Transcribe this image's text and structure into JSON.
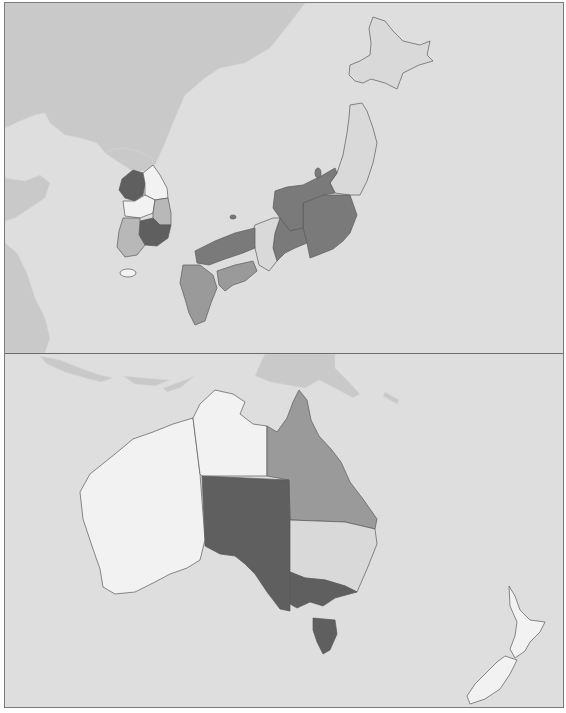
{
  "map": {
    "type": "choropleth",
    "palette": {
      "sea": "#dedede",
      "background_land": "#c9c9c9",
      "level_0": "#f2f2f2",
      "level_1": "#d9d9d9",
      "level_2": "#b8b8b8",
      "level_3": "#9a9a9a",
      "level_4": "#7a7a7a",
      "level_5": "#5f5f5f",
      "border": "#5a5a5a",
      "frame": "#7a7a7a"
    },
    "panels": [
      {
        "name": "East Asia (Japan & Korea)",
        "regions": [
          {
            "name": "Hokkaido",
            "level": 1
          },
          {
            "name": "Tohoku",
            "level": 1
          },
          {
            "name": "Kanto",
            "level": 4
          },
          {
            "name": "Chubu",
            "level": 4
          },
          {
            "name": "Tokai",
            "level": 4
          },
          {
            "name": "Kansai",
            "level": 1
          },
          {
            "name": "Chugoku",
            "level": 4
          },
          {
            "name": "Shikoku",
            "level": 3
          },
          {
            "name": "Kyushu",
            "level": 3
          },
          {
            "name": "Korea Capital Area",
            "level": 5
          },
          {
            "name": "Korea Gangwon",
            "level": 0
          },
          {
            "name": "Korea Chungcheong",
            "level": 0
          },
          {
            "name": "Korea Gyeongbuk",
            "level": 2
          },
          {
            "name": "Korea Gyeongnam",
            "level": 5
          },
          {
            "name": "Korea Jeolla",
            "level": 2
          },
          {
            "name": "Jeju",
            "level": 0
          }
        ]
      },
      {
        "name": "Oceania (Australia & New Zealand)",
        "regions": [
          {
            "name": "Western Australia",
            "level": 0
          },
          {
            "name": "Northern Territory",
            "level": 0
          },
          {
            "name": "Queensland",
            "level": 3
          },
          {
            "name": "South Australia",
            "level": 5
          },
          {
            "name": "New South Wales",
            "level": 1
          },
          {
            "name": "Victoria",
            "level": 5
          },
          {
            "name": "Tasmania",
            "level": 5
          },
          {
            "name": "New Zealand",
            "level": 0
          }
        ]
      }
    ]
  }
}
